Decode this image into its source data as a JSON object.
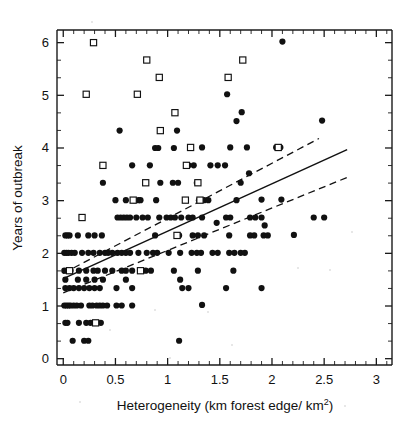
{
  "figure": {
    "title": "",
    "background": "#ffffff",
    "marker_color": "#111111"
  },
  "axes": {
    "x": {
      "label": "Heterogeneity (km forest edge/ km",
      "label_sup": "2",
      "label_tail": ")",
      "ticks": [
        "0",
        "0.5",
        "1",
        "1.5",
        "2",
        "2.5",
        "3"
      ],
      "tick_values": [
        0,
        0.5,
        1,
        1.5,
        2,
        2.5,
        3
      ],
      "min": -0.06,
      "max": 3.15,
      "minor_per_major": 5
    },
    "y": {
      "label": "Years of outbreak",
      "ticks": [
        "0",
        "1",
        "2",
        "3",
        "4",
        "5",
        "6"
      ],
      "tick_values": [
        0,
        1,
        2,
        3,
        4,
        5,
        6
      ],
      "min": -0.12,
      "max": 6.24,
      "minor_per_major": 3
    }
  },
  "chart_data": {
    "type": "scatter",
    "title": "",
    "xlabel": "Heterogeneity (km forest edge/ km2)",
    "ylabel": "Years of outbreak",
    "xlim": [
      -0.06,
      3.15
    ],
    "ylim": [
      -0.12,
      6.24
    ],
    "grid": false,
    "legend": "none",
    "series": [
      {
        "name": "filled-circle",
        "marker": "filled circle",
        "color": "#111111",
        "points": [
          [
            2.1,
            6.02
          ],
          [
            1.57,
            5.02
          ],
          [
            1.71,
            4.68
          ],
          [
            1.66,
            4.51
          ],
          [
            2.48,
            4.52
          ],
          [
            0.54,
            4.33
          ],
          [
            1.09,
            4.33
          ],
          [
            0.88,
            4.0
          ],
          [
            0.91,
            4.0
          ],
          [
            1.06,
            4.0
          ],
          [
            1.33,
            4.01
          ],
          [
            1.6,
            4.01
          ],
          [
            1.76,
            4.01
          ],
          [
            2.04,
            4.01
          ],
          [
            2.08,
            4.01
          ],
          [
            0.66,
            3.67
          ],
          [
            0.83,
            3.67
          ],
          [
            1.2,
            3.67
          ],
          [
            1.25,
            3.67
          ],
          [
            1.41,
            3.67
          ],
          [
            1.48,
            3.67
          ],
          [
            1.55,
            3.67
          ],
          [
            1.78,
            3.52
          ],
          [
            0.38,
            3.34
          ],
          [
            0.93,
            3.34
          ],
          [
            1.05,
            3.34
          ],
          [
            1.1,
            3.34
          ],
          [
            1.28,
            3.34
          ],
          [
            1.7,
            3.34
          ],
          [
            0.5,
            3.01
          ],
          [
            0.6,
            3.01
          ],
          [
            0.68,
            3.01
          ],
          [
            0.72,
            3.01
          ],
          [
            0.74,
            3.01
          ],
          [
            0.89,
            3.01
          ],
          [
            1.3,
            3.01
          ],
          [
            1.35,
            3.01
          ],
          [
            1.39,
            3.01
          ],
          [
            1.66,
            3.01
          ],
          [
            1.9,
            3.02
          ],
          [
            2.09,
            3.02
          ],
          [
            0.52,
            2.68
          ],
          [
            0.55,
            2.68
          ],
          [
            0.58,
            2.68
          ],
          [
            0.61,
            2.68
          ],
          [
            0.64,
            2.68
          ],
          [
            0.7,
            2.68
          ],
          [
            0.76,
            2.68
          ],
          [
            0.81,
            2.68
          ],
          [
            0.92,
            2.68
          ],
          [
            0.99,
            2.68
          ],
          [
            1.03,
            2.68
          ],
          [
            1.07,
            2.68
          ],
          [
            1.13,
            2.68
          ],
          [
            1.2,
            2.68
          ],
          [
            1.24,
            2.68
          ],
          [
            1.33,
            2.68
          ],
          [
            1.47,
            2.58
          ],
          [
            1.56,
            2.68
          ],
          [
            1.6,
            2.68
          ],
          [
            1.79,
            2.68
          ],
          [
            1.84,
            2.68
          ],
          [
            1.9,
            2.68
          ],
          [
            1.93,
            2.53
          ],
          [
            2.4,
            2.68
          ],
          [
            2.5,
            2.68
          ],
          [
            0.02,
            2.34
          ],
          [
            0.04,
            2.34
          ],
          [
            0.06,
            2.34
          ],
          [
            0.14,
            2.34
          ],
          [
            0.24,
            2.34
          ],
          [
            0.3,
            2.34
          ],
          [
            0.37,
            2.34
          ],
          [
            0.88,
            2.34
          ],
          [
            1.11,
            2.34
          ],
          [
            1.24,
            2.34
          ],
          [
            1.29,
            2.34
          ],
          [
            1.35,
            2.34
          ],
          [
            1.59,
            2.34
          ],
          [
            1.79,
            2.34
          ],
          [
            1.83,
            2.34
          ],
          [
            1.92,
            2.34
          ],
          [
            1.96,
            2.34
          ],
          [
            2.21,
            2.35
          ],
          [
            0.01,
            2.01
          ],
          [
            0.03,
            2.01
          ],
          [
            0.05,
            2.01
          ],
          [
            0.08,
            2.01
          ],
          [
            0.11,
            2.01
          ],
          [
            0.18,
            2.01
          ],
          [
            0.24,
            2.01
          ],
          [
            0.29,
            2.01
          ],
          [
            0.35,
            2.01
          ],
          [
            0.4,
            2.01
          ],
          [
            0.43,
            2.01
          ],
          [
            0.47,
            2.01
          ],
          [
            0.52,
            2.01
          ],
          [
            0.56,
            2.01
          ],
          [
            0.6,
            2.01
          ],
          [
            0.64,
            2.01
          ],
          [
            0.72,
            2.01
          ],
          [
            0.8,
            2.01
          ],
          [
            0.86,
            2.01
          ],
          [
            0.9,
            2.01
          ],
          [
            1.01,
            2.01
          ],
          [
            1.12,
            2.01
          ],
          [
            1.23,
            2.01
          ],
          [
            1.28,
            2.01
          ],
          [
            1.32,
            2.01
          ],
          [
            1.43,
            2.01
          ],
          [
            1.48,
            2.01
          ],
          [
            1.59,
            2.01
          ],
          [
            1.64,
            2.01
          ],
          [
            1.7,
            2.01
          ],
          [
            1.74,
            2.01
          ],
          [
            0.01,
            1.67
          ],
          [
            0.04,
            1.67
          ],
          [
            0.07,
            1.67
          ],
          [
            0.15,
            1.67
          ],
          [
            0.22,
            1.67
          ],
          [
            0.29,
            1.67
          ],
          [
            0.33,
            1.67
          ],
          [
            0.4,
            1.67
          ],
          [
            0.47,
            1.67
          ],
          [
            0.56,
            1.67
          ],
          [
            0.6,
            1.67
          ],
          [
            0.66,
            1.67
          ],
          [
            0.79,
            1.67
          ],
          [
            0.84,
            1.67
          ],
          [
            1.06,
            1.67
          ],
          [
            1.29,
            1.67
          ],
          [
            1.63,
            1.67
          ],
          [
            0.02,
            1.5
          ],
          [
            0.14,
            1.5
          ],
          [
            0.22,
            1.5
          ],
          [
            0.3,
            1.5
          ],
          [
            0.38,
            1.5
          ],
          [
            0.6,
            1.5
          ],
          [
            1.12,
            1.5
          ],
          [
            0.02,
            1.34
          ],
          [
            0.06,
            1.34
          ],
          [
            0.1,
            1.34
          ],
          [
            0.15,
            1.34
          ],
          [
            0.2,
            1.34
          ],
          [
            0.25,
            1.34
          ],
          [
            0.3,
            1.34
          ],
          [
            0.35,
            1.34
          ],
          [
            0.51,
            1.34
          ],
          [
            0.66,
            1.34
          ],
          [
            1.14,
            1.34
          ],
          [
            1.2,
            1.34
          ],
          [
            1.56,
            1.34
          ],
          [
            1.9,
            1.34
          ],
          [
            0.01,
            1.01
          ],
          [
            0.03,
            1.01
          ],
          [
            0.05,
            1.01
          ],
          [
            0.07,
            1.01
          ],
          [
            0.1,
            1.01
          ],
          [
            0.13,
            1.01
          ],
          [
            0.17,
            1.01
          ],
          [
            0.25,
            1.01
          ],
          [
            0.28,
            1.01
          ],
          [
            0.32,
            1.01
          ],
          [
            0.35,
            1.01
          ],
          [
            0.38,
            1.01
          ],
          [
            0.42,
            1.01
          ],
          [
            0.51,
            1.01
          ],
          [
            0.56,
            1.01
          ],
          [
            0.66,
            1.01
          ],
          [
            1.33,
            1.02
          ],
          [
            0.02,
            0.68
          ],
          [
            0.04,
            0.68
          ],
          [
            0.15,
            0.68
          ],
          [
            0.22,
            0.68
          ],
          [
            0.26,
            0.68
          ],
          [
            0.36,
            0.68
          ],
          [
            0.09,
            0.34
          ],
          [
            0.2,
            0.34
          ],
          [
            0.24,
            0.34
          ],
          [
            1.11,
            0.34
          ]
        ]
      },
      {
        "name": "open-square",
        "marker": "open square",
        "color": "#ffffff",
        "points": [
          [
            0.29,
            6.0
          ],
          [
            0.8,
            5.67
          ],
          [
            1.72,
            5.67
          ],
          [
            0.92,
            5.34
          ],
          [
            1.58,
            5.34
          ],
          [
            0.22,
            5.02
          ],
          [
            0.71,
            5.02
          ],
          [
            1.07,
            4.67
          ],
          [
            0.93,
            4.33
          ],
          [
            1.22,
            4.01
          ],
          [
            2.06,
            4.01
          ],
          [
            0.38,
            3.67
          ],
          [
            1.18,
            3.67
          ],
          [
            0.79,
            3.34
          ],
          [
            1.29,
            3.34
          ],
          [
            0.67,
            3.01
          ],
          [
            1.17,
            3.01
          ],
          [
            1.31,
            3.01
          ],
          [
            0.18,
            2.68
          ],
          [
            1.09,
            2.34
          ],
          [
            0.06,
            1.67
          ],
          [
            0.74,
            1.67
          ],
          [
            0.31,
            0.68
          ]
        ]
      }
    ],
    "fit": {
      "name": "regression-line",
      "style": "solid",
      "x_start": 0.0,
      "x_end": 2.72,
      "y_start": 1.52,
      "y_end": 3.97
    },
    "confidence_bands": [
      {
        "name": "upper-confidence-band",
        "style": "dashed",
        "x_start": 0.0,
        "x_end": 2.45,
        "y_start": 1.62,
        "y_end": 4.18
      },
      {
        "name": "lower-confidence-band",
        "style": "dashed",
        "x_start": 0.0,
        "x_end": 2.72,
        "y_start": 1.25,
        "y_end": 3.44
      }
    ]
  }
}
